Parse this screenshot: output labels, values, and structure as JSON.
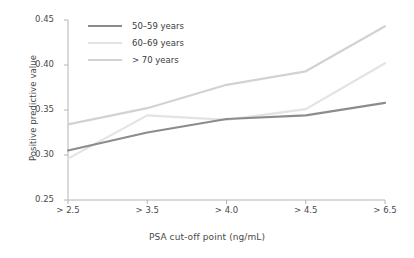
{
  "chart_data": {
    "type": "line",
    "title": "",
    "xlabel": "PSA cut-off point (ng/mL)",
    "ylabel": "Positive predictive value",
    "categories": [
      "> 2.5",
      "> 3.5",
      "> 4.0",
      "> 4.5",
      "> 6.5"
    ],
    "ylim": [
      0.25,
      0.45
    ],
    "yticks": [
      "0.25",
      "0.30",
      "0.35",
      "0.40",
      "0.45"
    ],
    "ytick_values": [
      0.25,
      0.3,
      0.35,
      0.4,
      0.45
    ],
    "grid": false,
    "legend_position": "top-left",
    "series": [
      {
        "name": "50–59 years",
        "color": "#8c8c8c",
        "values": [
          0.305,
          0.325,
          0.34,
          0.344,
          0.358
        ]
      },
      {
        "name": "60–69 years",
        "color": "#e3e3e3",
        "values": [
          0.296,
          0.344,
          0.339,
          0.351,
          0.402
        ]
      },
      {
        "name": "> 70 years",
        "color": "#d2d2d2",
        "values": [
          0.334,
          0.352,
          0.378,
          0.393,
          0.443
        ]
      }
    ]
  },
  "axis": {
    "line_color": "#b4b4b4"
  }
}
